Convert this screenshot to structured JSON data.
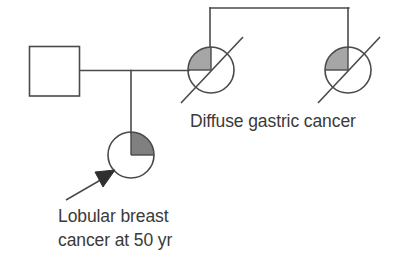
{
  "diagram": {
    "kind": "pedigree-chart",
    "title": "",
    "background_color": "#ffffff",
    "line_color": "#4a4a4a",
    "text_color": "#3a3a3a",
    "shade_color_gastric": "#a6a6a6",
    "shade_color_breast": "#808080"
  },
  "individuals": [
    {
      "id": "father",
      "shape": "square",
      "sex": "male",
      "affected": false,
      "deceased": false,
      "proband": false,
      "shaded_quadrant": "none",
      "x": 54,
      "y": 71,
      "size": 50
    },
    {
      "id": "mother",
      "shape": "circle",
      "sex": "female",
      "affected": true,
      "deceased": true,
      "proband": false,
      "shaded_quadrant": "upper-left",
      "shade_color": "#a6a6a6",
      "x": 211,
      "y": 70,
      "radius": 23
    },
    {
      "id": "aunt",
      "shape": "circle",
      "sex": "female",
      "affected": true,
      "deceased": true,
      "proband": false,
      "shaded_quadrant": "upper-left",
      "shade_color": "#a6a6a6",
      "x": 348,
      "y": 70,
      "radius": 23
    },
    {
      "id": "daughter",
      "shape": "circle",
      "sex": "female",
      "affected": true,
      "deceased": false,
      "proband": true,
      "shaded_quadrant": "upper-right",
      "shade_color": "#808080",
      "x": 131,
      "y": 155,
      "radius": 23
    }
  ],
  "connections": [
    {
      "id": "mating-line",
      "type": "horizontal",
      "from": [
        79,
        70
      ],
      "to": [
        188,
        70
      ]
    },
    {
      "id": "descent-line",
      "type": "vertical",
      "from": [
        131,
        70
      ],
      "to": [
        131,
        132
      ]
    },
    {
      "id": "sibship-line",
      "type": "horizontal",
      "from": [
        210,
        8
      ],
      "to": [
        348,
        8
      ]
    },
    {
      "id": "sibship-drop-left",
      "type": "vertical",
      "from": [
        210,
        8
      ],
      "to": [
        210,
        47
      ]
    },
    {
      "id": "sibship-drop-right",
      "type": "vertical",
      "from": [
        348,
        8
      ],
      "to": [
        348,
        47
      ]
    }
  ],
  "labels": {
    "gastric": {
      "text": "Diffuse gastric cancer",
      "x": 190,
      "y": 127
    },
    "breast": {
      "line1": "Lobular breast",
      "line2": "cancer at 50 yr",
      "x": 58,
      "y1": 222,
      "y2": 246
    }
  },
  "proband_arrow": {
    "id": "proband-arrow",
    "points_to": "daughter",
    "tail": [
      66,
      199
    ],
    "head": [
      113,
      172
    ]
  }
}
